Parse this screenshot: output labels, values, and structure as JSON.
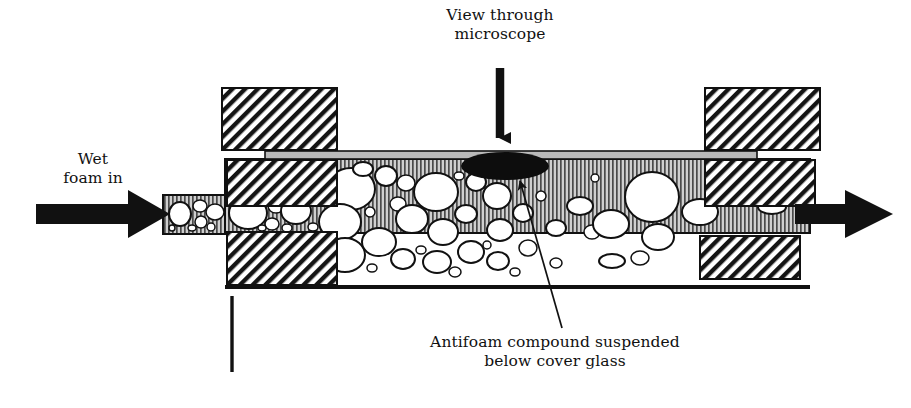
{
  "diagram": {
    "type": "cross-section-schematic",
    "background_color": "#ffffff",
    "ink_color": "#111111"
  },
  "labels": {
    "view_through_microscope": "View through\nmicroscope",
    "wet_foam_in": "Wet\nfoam in",
    "antifoam_caption": "Antifoam compound suspended\nbelow cover glass"
  },
  "arrows": {
    "microscope_arrow": {
      "direction": "down",
      "x": 500,
      "y_start": 68,
      "y_end": 150
    },
    "inlet_arrow": {
      "direction": "right",
      "x_start": 36,
      "y": 214,
      "x_end": 165
    },
    "outlet_arrow": {
      "direction": "right",
      "x_start": 795,
      "y": 214,
      "x_end": 893
    },
    "antifoam_leader": {
      "direction": "up-left",
      "x_start": 562,
      "y_start": 328,
      "x_end": 516,
      "y_end": 178
    }
  },
  "parts": {
    "cover_glass": {
      "x": 265,
      "y": 151,
      "width": 492,
      "height": 8,
      "fill": "#b9b9b9"
    },
    "channel": {
      "x": 225,
      "y": 160,
      "width": 585,
      "height": 72,
      "fill": "striped-gray"
    },
    "inlet_tube": {
      "x": 163,
      "y": 195,
      "width": 64,
      "height": 39,
      "fill": "striped-gray"
    },
    "baseline": {
      "x": 225,
      "y": 286,
      "width": 585,
      "height": 4,
      "fill": "#111111"
    },
    "pointer_line": {
      "x": 232,
      "y_start": 296,
      "y_end": 372
    },
    "antifoam_blob": {
      "cx": 505,
      "cy": 166,
      "rx": 44,
      "ry": 14,
      "fill": "#0d0d0d"
    },
    "clamp_blocks": [
      {
        "name": "top-left",
        "x": 222,
        "y": 88,
        "width": 115,
        "height": 62
      },
      {
        "name": "top-right",
        "x": 705,
        "y": 88,
        "width": 115,
        "height": 62
      },
      {
        "name": "mid-left",
        "x": 227,
        "y": 160,
        "width": 110,
        "height": 46
      },
      {
        "name": "mid-right",
        "x": 705,
        "y": 160,
        "width": 110,
        "height": 46
      },
      {
        "name": "bottom-left",
        "x": 227,
        "y": 232,
        "width": 110,
        "height": 53
      },
      {
        "name": "bottom-right",
        "x": 700,
        "y": 236,
        "width": 100,
        "height": 43
      }
    ]
  },
  "bubbles": {
    "description": "White gas bubbles suspended in the foam channel",
    "inlet": [
      {
        "cx": 180,
        "cy": 214,
        "rx": 11,
        "ry": 12
      },
      {
        "cx": 200,
        "cy": 206,
        "rx": 7,
        "ry": 6
      },
      {
        "cx": 201,
        "cy": 222,
        "rx": 6,
        "ry": 6
      },
      {
        "cx": 215,
        "cy": 212,
        "rx": 9,
        "ry": 8
      },
      {
        "cx": 192,
        "cy": 228,
        "rx": 4,
        "ry": 3
      },
      {
        "cx": 211,
        "cy": 227,
        "rx": 4,
        "ry": 4
      },
      {
        "cx": 172,
        "cy": 228,
        "rx": 3,
        "ry": 3
      }
    ],
    "left_chamber": [
      {
        "cx": 248,
        "cy": 213,
        "rx": 19,
        "ry": 16
      },
      {
        "cx": 276,
        "cy": 206,
        "rx": 8,
        "ry": 7
      },
      {
        "cx": 272,
        "cy": 224,
        "rx": 7,
        "ry": 6
      },
      {
        "cx": 296,
        "cy": 211,
        "rx": 15,
        "ry": 13
      },
      {
        "cx": 287,
        "cy": 228,
        "rx": 5,
        "ry": 4
      },
      {
        "cx": 313,
        "cy": 227,
        "rx": 5,
        "ry": 4
      },
      {
        "cx": 262,
        "cy": 228,
        "rx": 4,
        "ry": 3
      }
    ],
    "main_chamber": [
      {
        "cx": 351,
        "cy": 189,
        "rx": 24,
        "ry": 21
      },
      {
        "cx": 340,
        "cy": 222,
        "rx": 21,
        "ry": 18
      },
      {
        "cx": 345,
        "cy": 255,
        "rx": 20,
        "ry": 17
      },
      {
        "cx": 379,
        "cy": 242,
        "rx": 17,
        "ry": 14
      },
      {
        "cx": 386,
        "cy": 176,
        "rx": 11,
        "ry": 10
      },
      {
        "cx": 406,
        "cy": 183,
        "rx": 9,
        "ry": 8
      },
      {
        "cx": 398,
        "cy": 204,
        "rx": 8,
        "ry": 7
      },
      {
        "cx": 412,
        "cy": 219,
        "rx": 16,
        "ry": 14
      },
      {
        "cx": 403,
        "cy": 259,
        "rx": 12,
        "ry": 10
      },
      {
        "cx": 436,
        "cy": 192,
        "rx": 22,
        "ry": 19
      },
      {
        "cx": 443,
        "cy": 232,
        "rx": 15,
        "ry": 13
      },
      {
        "cx": 437,
        "cy": 262,
        "rx": 14,
        "ry": 11
      },
      {
        "cx": 466,
        "cy": 214,
        "rx": 11,
        "ry": 9
      },
      {
        "cx": 471,
        "cy": 252,
        "rx": 13,
        "ry": 11
      },
      {
        "cx": 476,
        "cy": 182,
        "rx": 10,
        "ry": 9
      },
      {
        "cx": 497,
        "cy": 196,
        "rx": 14,
        "ry": 13
      },
      {
        "cx": 500,
        "cy": 230,
        "rx": 13,
        "ry": 11
      },
      {
        "cx": 498,
        "cy": 261,
        "rx": 11,
        "ry": 9
      },
      {
        "cx": 523,
        "cy": 213,
        "rx": 10,
        "ry": 9
      },
      {
        "cx": 528,
        "cy": 248,
        "rx": 9,
        "ry": 8
      },
      {
        "cx": 363,
        "cy": 169,
        "rx": 10,
        "ry": 7
      },
      {
        "cx": 320,
        "cy": 180,
        "rx": 8,
        "ry": 7
      },
      {
        "cx": 322,
        "cy": 244,
        "rx": 7,
        "ry": 6
      },
      {
        "cx": 370,
        "cy": 212,
        "rx": 5,
        "ry": 5
      },
      {
        "cx": 372,
        "cy": 268,
        "rx": 5,
        "ry": 4
      },
      {
        "cx": 421,
        "cy": 250,
        "rx": 5,
        "ry": 4
      },
      {
        "cx": 459,
        "cy": 176,
        "rx": 5,
        "ry": 4
      },
      {
        "cx": 487,
        "cy": 245,
        "rx": 4,
        "ry": 4
      },
      {
        "cx": 515,
        "cy": 272,
        "rx": 5,
        "ry": 4
      },
      {
        "cx": 455,
        "cy": 272,
        "rx": 6,
        "ry": 5
      }
    ],
    "right_chamber": [
      {
        "cx": 556,
        "cy": 228,
        "rx": 10,
        "ry": 8
      },
      {
        "cx": 580,
        "cy": 206,
        "rx": 13,
        "ry": 9
      },
      {
        "cx": 592,
        "cy": 232,
        "rx": 8,
        "ry": 7
      },
      {
        "cx": 611,
        "cy": 224,
        "rx": 18,
        "ry": 14
      },
      {
        "cx": 652,
        "cy": 197,
        "rx": 27,
        "ry": 25
      },
      {
        "cx": 658,
        "cy": 237,
        "rx": 16,
        "ry": 13
      },
      {
        "cx": 640,
        "cy": 258,
        "rx": 9,
        "ry": 7
      },
      {
        "cx": 700,
        "cy": 212,
        "rx": 18,
        "ry": 13
      },
      {
        "cx": 772,
        "cy": 207,
        "rx": 14,
        "ry": 7
      },
      {
        "cx": 612,
        "cy": 261,
        "rx": 13,
        "ry": 7
      },
      {
        "cx": 556,
        "cy": 263,
        "rx": 6,
        "ry": 5
      },
      {
        "cx": 541,
        "cy": 196,
        "rx": 5,
        "ry": 5
      },
      {
        "cx": 595,
        "cy": 178,
        "rx": 4,
        "ry": 4
      },
      {
        "cx": 730,
        "cy": 262,
        "rx": 12,
        "ry": 6
      }
    ]
  }
}
